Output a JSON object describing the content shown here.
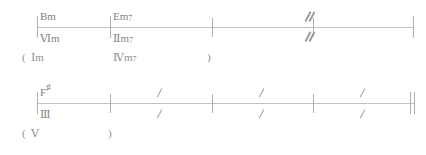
{
  "document": {
    "type": "chord-chart",
    "title": "Chord progression lead sheet",
    "colors": {
      "ink": "#8a8a8a",
      "staff_line": "#c3c3c3",
      "barline": "#b0b0b0",
      "mark": "#9e9e9e",
      "background": "#ffffff"
    }
  },
  "systems": [
    {
      "id": "system-1",
      "staff": {
        "x": 37,
        "y": 27,
        "width": 377
      },
      "barlines": [
        {
          "x": 37,
          "y": 16,
          "height": 22
        },
        {
          "x": 110,
          "y": 16,
          "height": 22
        },
        {
          "x": 212,
          "y": 18,
          "height": 19
        },
        {
          "x": 313,
          "y": 18,
          "height": 19
        },
        {
          "x": 413,
          "y": 16,
          "height": 22
        }
      ],
      "chords": [
        {
          "x": 40,
          "y": 8,
          "root": "B",
          "accidental": "",
          "quality": "m",
          "ext": ""
        },
        {
          "x": 113,
          "y": 8,
          "root": "E",
          "accidental": "",
          "quality": "m",
          "ext": "7"
        }
      ],
      "romans": [
        {
          "x": 40,
          "y": 33,
          "numeral": "Ⅵ",
          "quality": "m",
          "ext": ""
        },
        {
          "x": 113,
          "y": 33,
          "numeral": "Ⅱ",
          "quality": "m",
          "ext": "7"
        }
      ],
      "parenthetical": {
        "open": {
          "x": 22,
          "y": 52,
          "text": "("
        },
        "items": [
          {
            "x": 31,
            "y": 52,
            "numeral": "Ⅰ",
            "quality": "m",
            "ext": ""
          },
          {
            "x": 113,
            "y": 52,
            "numeral": "Ⅳ",
            "quality": "m",
            "ext": "7"
          }
        ],
        "close": {
          "x": 207,
          "y": 52,
          "text": ")"
        }
      },
      "marks": [
        {
          "x": 305,
          "y": 11,
          "style": "double"
        },
        {
          "x": 305,
          "y": 31,
          "style": "double"
        }
      ]
    },
    {
      "id": "system-2",
      "staff": {
        "x": 37,
        "y": 28,
        "width": 378
      },
      "barlines": [
        {
          "x": 37,
          "y": 17,
          "height": 22
        },
        {
          "x": 110,
          "y": 19,
          "height": 19
        },
        {
          "x": 212,
          "y": 19,
          "height": 19
        },
        {
          "x": 313,
          "y": 19,
          "height": 19
        },
        {
          "x": 410,
          "y": 17,
          "height": 22
        },
        {
          "x": 414,
          "y": 17,
          "height": 22
        }
      ],
      "chords": [
        {
          "x": 40,
          "y": 9,
          "root": "F",
          "accidental": "♯",
          "quality": "",
          "ext": ""
        }
      ],
      "romans": [
        {
          "x": 40,
          "y": 34,
          "numeral": "Ⅲ",
          "quality": "",
          "ext": ""
        }
      ],
      "parenthetical": {
        "open": {
          "x": 22,
          "y": 53,
          "text": "("
        },
        "items": [
          {
            "x": 31,
            "y": 53,
            "numeral": "Ⅴ",
            "quality": "",
            "ext": ""
          }
        ],
        "close": {
          "x": 108,
          "y": 53,
          "text": ")"
        }
      },
      "marks": [
        {
          "x": 155,
          "y": 12,
          "style": "single"
        },
        {
          "x": 155,
          "y": 33,
          "style": "single"
        },
        {
          "x": 257,
          "y": 12,
          "style": "single"
        },
        {
          "x": 257,
          "y": 33,
          "style": "single"
        },
        {
          "x": 358,
          "y": 12,
          "style": "single"
        },
        {
          "x": 358,
          "y": 33,
          "style": "single"
        }
      ]
    }
  ]
}
